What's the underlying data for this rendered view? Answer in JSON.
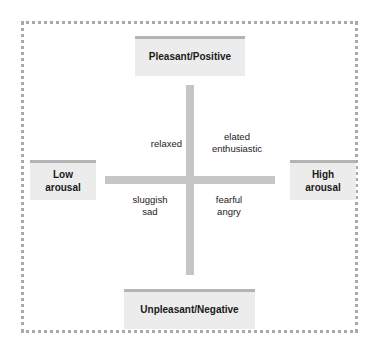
{
  "diagram": {
    "type": "circumplex-model-of-affect",
    "colors": {
      "background": "#ffffff",
      "frame_border": "#a9a9a9",
      "axis_bar": "#c6c6c6",
      "box_fill": "#ececec",
      "box_top_border": "#b4b4b4",
      "text": "#1a1a1a"
    },
    "poles": {
      "top": "Pleasant/Positive",
      "bottom": "Unpleasant/Negative",
      "left": "Low\narousal",
      "right": "High\narousal"
    },
    "quadrants": {
      "top_left": "relaxed",
      "top_right": "elated\nenthusiastic",
      "bottom_left": "sluggish\nsad",
      "bottom_right": "fearful\nangry"
    }
  }
}
